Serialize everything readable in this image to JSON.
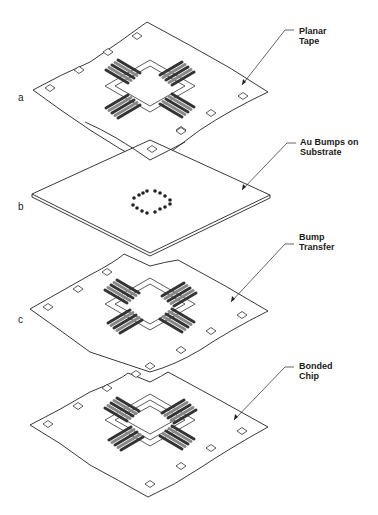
{
  "diagram": {
    "type": "exploded-isometric-process",
    "layers": [
      {
        "id": "a",
        "letter": "a",
        "label_line1": "Planar",
        "label_line2": "Tape"
      },
      {
        "id": "b",
        "letter": "b",
        "label_line1": "Au Bumps on",
        "label_line2": "Substrate"
      },
      {
        "id": "c",
        "letter": "c",
        "label_line1": "Bump",
        "label_line2": "Transfer"
      },
      {
        "id": "d",
        "letter": "",
        "label_line1": "Bonded",
        "label_line2": "Chip"
      }
    ],
    "colors": {
      "line": "#222222",
      "background": "#ffffff",
      "lead_dark": "#333333",
      "lead_light": "#9a9a9a"
    }
  }
}
